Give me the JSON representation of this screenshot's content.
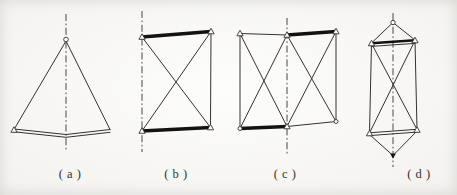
{
  "colors": {
    "background": "#fbfaf7",
    "ink": "#35322d",
    "bar": "#14120f"
  },
  "figures": [
    {
      "label": "( a )"
    },
    {
      "label": "( b )"
    },
    {
      "label": "( c )"
    },
    {
      "label": "( d )"
    }
  ]
}
